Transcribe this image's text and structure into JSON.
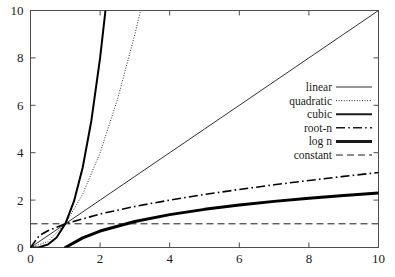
{
  "chart_data": {
    "type": "line",
    "title": "",
    "subtitle": "",
    "xlabel": "",
    "ylabel": "",
    "xlim": [
      0,
      10
    ],
    "ylim": [
      0,
      10
    ],
    "xticks": [
      0,
      2,
      4,
      6,
      8,
      10
    ],
    "yticks": [
      0,
      2,
      4,
      6,
      8,
      10
    ],
    "xticklabels": [
      "0",
      "2",
      "4",
      "6",
      "8",
      "10"
    ],
    "yticklabels": [
      "0",
      "2",
      "4",
      "6",
      "8",
      "10"
    ],
    "grid": false,
    "legend_position": "center-right",
    "background": "#ffffff",
    "axis_color": "#4d4d4d",
    "series": [
      {
        "name": "linear",
        "formula": "n",
        "style": "solid",
        "width": 0.9,
        "color": "#1a1a1a",
        "x": [
          0,
          1,
          2,
          3,
          4,
          5,
          6,
          7,
          8,
          9,
          10
        ],
        "values": [
          0,
          1,
          2,
          3,
          4,
          5,
          6,
          7,
          8,
          9,
          10
        ]
      },
      {
        "name": "quadratic",
        "formula": "n^2",
        "style": "dotted",
        "width": 1.0,
        "color": "#1a1a1a",
        "x": [
          0,
          0.5,
          1,
          1.5,
          2,
          2.5,
          3,
          3.1623
        ],
        "values": [
          0,
          0.25,
          1,
          2.25,
          4,
          6.25,
          9,
          10
        ]
      },
      {
        "name": "cubic",
        "formula": "n^3",
        "style": "solid",
        "width": 2.0,
        "color": "#000000",
        "x": [
          0,
          0.25,
          0.5,
          0.75,
          1,
          1.25,
          1.5,
          1.75,
          2,
          2.1544
        ],
        "values": [
          0,
          0.0156,
          0.125,
          0.4219,
          1,
          1.9531,
          3.375,
          5.3594,
          8,
          10
        ]
      },
      {
        "name": "root-n",
        "formula": "sqrt(n)",
        "style": "dashdot",
        "width": 1.6,
        "color": "#000000",
        "x": [
          0,
          0.25,
          0.5,
          1,
          2,
          3,
          4,
          5,
          6,
          7,
          8,
          9,
          10
        ],
        "values": [
          0,
          0.5,
          0.7071,
          1,
          1.4142,
          1.7321,
          2,
          2.2361,
          2.4495,
          2.6458,
          2.8284,
          3,
          3.1623
        ]
      },
      {
        "name": "log n",
        "formula": "ln(n)",
        "style": "solid",
        "width": 3.0,
        "color": "#000000",
        "x": [
          1,
          1.5,
          2,
          3,
          4,
          5,
          6,
          7,
          8,
          9,
          10
        ],
        "values": [
          0,
          0.4055,
          0.6931,
          1.0986,
          1.3863,
          1.6094,
          1.7918,
          1.9459,
          2.0794,
          2.1972,
          2.3026
        ]
      },
      {
        "name": "constant",
        "formula": "1",
        "style": "dashed",
        "width": 1.0,
        "color": "#1a1a1a",
        "x": [
          0,
          10
        ],
        "values": [
          1,
          1
        ]
      }
    ],
    "legend": [
      {
        "label": "linear",
        "style": "solid",
        "width": 0.9
      },
      {
        "label": "quadratic",
        "style": "dotted",
        "width": 1.0
      },
      {
        "label": "cubic",
        "style": "solid",
        "width": 2.0
      },
      {
        "label": "root-n",
        "style": "dashdot",
        "width": 1.6
      },
      {
        "label": "log n",
        "style": "solid",
        "width": 3.0
      },
      {
        "label": "constant",
        "style": "dashed",
        "width": 1.0
      }
    ]
  }
}
